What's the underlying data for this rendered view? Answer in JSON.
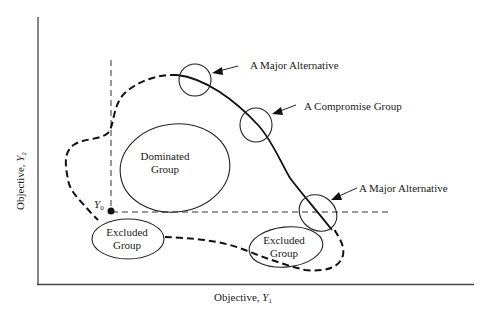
{
  "diagram": {
    "type": "objective-space diagram",
    "axes": {
      "x_label": "Objective, ",
      "x_symbol": "Y",
      "x_subscript": "1",
      "y_label": "Objective, ",
      "y_symbol": "Y",
      "y_subscript": "2"
    },
    "reference_point": {
      "symbol": "Y",
      "subscript": "0"
    },
    "groups": {
      "dominated": {
        "line1": "Dominated",
        "line2": "Group"
      },
      "excluded_left": {
        "line1": "Excluded",
        "line2": "Group"
      },
      "excluded_right": {
        "line1": "Excluded",
        "line2": "Group"
      }
    },
    "callouts": {
      "major_alternative_top": "A Major Alternative",
      "compromise_group": "A Compromise Group",
      "major_alternative_bottom": "A Major Alternative"
    },
    "legend": {
      "solid_curve": "nondominated frontier",
      "dashed_curve": "feasible region boundary"
    }
  }
}
